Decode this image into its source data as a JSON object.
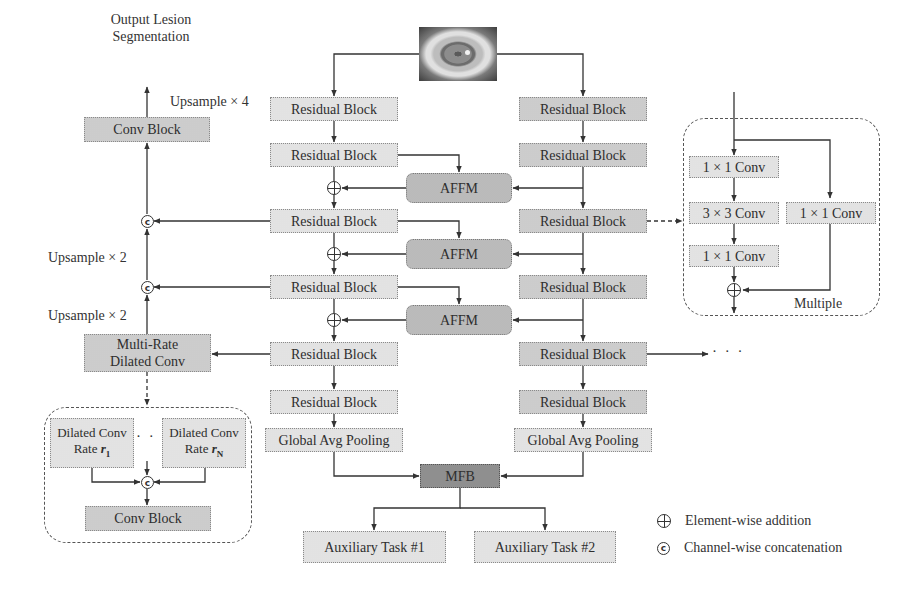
{
  "diagram": {
    "input": {
      "label": "input eye image",
      "icon": "eye-image"
    },
    "output_label": "Output Lesion Segmentation",
    "output_label_lines": [
      "Output Lesion",
      "Segmentation"
    ],
    "upsample_labels": [
      "Upsample × 4",
      "Upsample × 2",
      "Upsample × 2"
    ],
    "left_stream": {
      "blocks": [
        "Residual Block",
        "Residual Block",
        "Residual Block",
        "Residual Block",
        "Residual Block",
        "Residual Block"
      ],
      "pooling": "Global Avg Pooling"
    },
    "right_stream": {
      "blocks": [
        "Residual Block",
        "Residual Block",
        "Residual Block",
        "Residual Block",
        "Residual Block",
        "Residual Block"
      ],
      "pooling": "Global Avg Pooling",
      "continuation": "· · ·"
    },
    "fusion_modules": [
      "AFFM",
      "AFFM",
      "AFFM"
    ],
    "decoder": {
      "conv_block": "Conv Block",
      "multi_rate_lines": [
        "Multi-Rate",
        "Dilated Conv"
      ]
    },
    "dilated_detail": {
      "branch_1": {
        "line1": "Dilated Conv",
        "line2": "Rate ",
        "rate": "r",
        "sub": "1"
      },
      "branch_n": {
        "line1": "Dilated Conv",
        "line2": "Rate ",
        "rate": "r",
        "sub": "N"
      },
      "ellipsis": "· · ·",
      "conv_block": "Conv Block"
    },
    "residual_detail": {
      "left": [
        "1 × 1 Conv",
        "3 × 3 Conv",
        "1 × 1 Conv"
      ],
      "right": "1 × 1 Conv",
      "note": "Multiple"
    },
    "mfb": "MFB",
    "aux_tasks": [
      "Auxiliary Task #1",
      "Auxiliary Task #2"
    ],
    "legend": [
      {
        "symbol": "element-wise-addition",
        "glyph": "⊕",
        "label": "Element-wise addition"
      },
      {
        "symbol": "channel-wise-concatenation",
        "glyph": "c",
        "label": "Channel-wise concatenation"
      }
    ],
    "concat_glyph": "c"
  }
}
